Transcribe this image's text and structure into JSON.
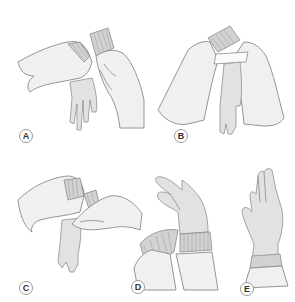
{
  "figure": {
    "panels": [
      {
        "id": "A",
        "label": "A",
        "description": "Right hand grasps folded cuff of glove; left hand with gown cuff held up"
      },
      {
        "id": "B",
        "label": "B",
        "description": "Both hands within gown sleeves hold glove cuff open with paper wrapper"
      },
      {
        "id": "C",
        "label": "C",
        "description": "Gloved hand slides fingers under cuff of second glove"
      },
      {
        "id": "D",
        "label": "D",
        "description": "Glove cuff pulled up over gown sleeve knit cuff"
      },
      {
        "id": "E",
        "label": "E",
        "description": "Fully gloved hand with cuff over gown sleeve"
      }
    ]
  },
  "colors": {
    "skin": "#f0f0f0",
    "glove": "#e2e2e2",
    "cuff": "#d2d2d2",
    "outline": "#8a8a8a",
    "label_border": "#9a9a9a",
    "label_text": "#333333"
  }
}
